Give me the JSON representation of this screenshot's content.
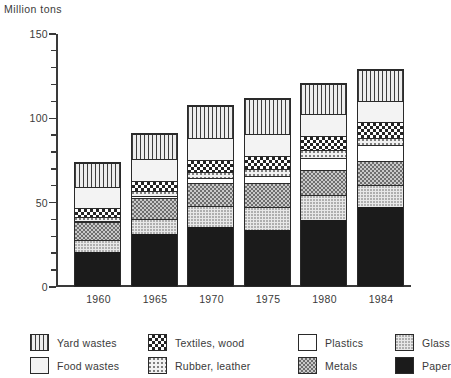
{
  "chart_data": {
    "type": "bar",
    "subtype": "stacked",
    "title": "",
    "ylabel": "Million tons",
    "xlabel": "",
    "ylim": [
      0,
      150
    ],
    "yticks": [
      0,
      50,
      100,
      150
    ],
    "ytick_labels": [
      "0",
      "50",
      "100",
      "150"
    ],
    "yminor_step": 10,
    "grid": false,
    "legend_position": "bottom",
    "categories": [
      "1960",
      "1965",
      "1970",
      "1975",
      "1980",
      "1984"
    ],
    "series": [
      {
        "name": "Paper",
        "pattern": "solid-black",
        "values": [
          20.0,
          31.0,
          35.0,
          33.0,
          39.0,
          47.0
        ]
      },
      {
        "name": "Glass",
        "pattern": "light-stipple",
        "values": [
          7.0,
          9.0,
          12.5,
          14.0,
          15.0,
          13.0
        ]
      },
      {
        "name": "Metals",
        "pattern": "dense-checker",
        "values": [
          11.0,
          12.0,
          13.5,
          14.0,
          14.5,
          14.0
        ]
      },
      {
        "name": "Plastics",
        "pattern": "white",
        "values": [
          0.5,
          1.5,
          3.0,
          4.5,
          7.5,
          9.5
        ]
      },
      {
        "name": "Rubber, leather",
        "pattern": "sparse-dots",
        "values": [
          2.5,
          3.0,
          3.5,
          4.0,
          4.5,
          4.5
        ]
      },
      {
        "name": "Textiles, wood",
        "pattern": "coarse-checker",
        "values": [
          5.0,
          6.0,
          7.0,
          7.5,
          8.5,
          9.0
        ]
      },
      {
        "name": "Food wastes",
        "pattern": "fine-stipple",
        "values": [
          12.5,
          13.0,
          13.0,
          13.0,
          13.0,
          13.0
        ]
      },
      {
        "name": "Yard wastes",
        "pattern": "vertical-lines",
        "values": [
          14.5,
          14.5,
          19.5,
          21.0,
          18.0,
          18.0
        ]
      }
    ],
    "totals": [
      73,
      90,
      107,
      111,
      120,
      128
    ]
  },
  "legend": {
    "items": [
      {
        "label": "Yard wastes",
        "swatch": "p-yard"
      },
      {
        "label": "Textiles, wood",
        "swatch": "p-textiles"
      },
      {
        "label": "Plastics",
        "swatch": "p-plastics"
      },
      {
        "label": "Glass",
        "swatch": "p-glass"
      },
      {
        "label": "Food wastes",
        "swatch": "p-food"
      },
      {
        "label": "Rubber, leather",
        "swatch": "p-rubber"
      },
      {
        "label": "Metals",
        "swatch": "p-metals"
      },
      {
        "label": "Paper",
        "swatch": "p-paper"
      }
    ]
  },
  "colors": {
    "axis": "#3a3a3a",
    "text": "#3a3a3a",
    "paper": "#1b1b1b",
    "background": "#ffffff"
  }
}
